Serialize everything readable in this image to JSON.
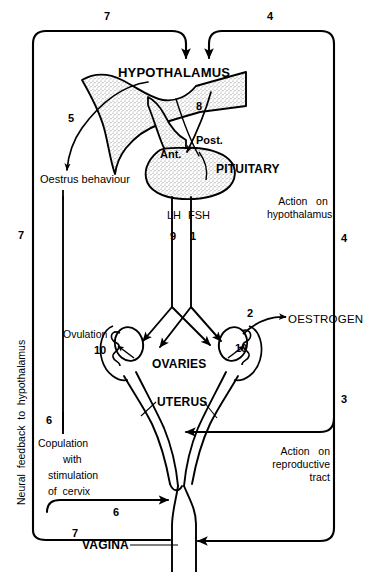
{
  "diagram": {
    "type": "biological-flow-diagram",
    "ink_color": "#000000",
    "background_color": "#ffffff",
    "stipple_color": "#9a9a9a"
  },
  "anatomy": [
    {
      "id": "hypothalamus",
      "label": "HYPOTHALAMUS",
      "style": "bold"
    },
    {
      "id": "pituitary",
      "label": "PITUITARY",
      "style": "bold"
    },
    {
      "id": "anterior-pituitary",
      "label": "Ant.",
      "style": "bold"
    },
    {
      "id": "posterior-pituitary",
      "label": "Post.",
      "style": "bold"
    },
    {
      "id": "ovaries",
      "label": "OVARIES",
      "style": "bold"
    },
    {
      "id": "uterus",
      "label": "UTERUS",
      "style": "bold"
    },
    {
      "id": "vagina",
      "label": "VAGINA",
      "style": "bold"
    }
  ],
  "hormones": [
    {
      "id": "lh",
      "label": "LH",
      "step": "9"
    },
    {
      "id": "fsh",
      "label": "FSH",
      "step": "1"
    },
    {
      "id": "oestrogen",
      "label": "OESTROGEN",
      "step": "2"
    }
  ],
  "events": [
    {
      "id": "oestrus-behaviour",
      "label": "Oestrus behaviour",
      "step": "5"
    },
    {
      "id": "ovulation",
      "label": "Ovulation",
      "step": "10"
    },
    {
      "id": "ovulation-right",
      "label": "",
      "step": "10"
    },
    {
      "id": "copulation",
      "label": "Copulation\nwith\nstimulation\nof cervix",
      "step": "6"
    }
  ],
  "pathways": [
    {
      "id": "action-on-hypothalamus",
      "label": "Action  on\nhypothalamus",
      "step": "4"
    },
    {
      "id": "action-on-reproductive-tract",
      "label": "Action  on\nreproductive\ntract",
      "step": "3"
    },
    {
      "id": "neural-feedback",
      "label": "Neural  feedback  to  hypothalamus",
      "step": "7"
    }
  ],
  "steps": {
    "top_left": "7",
    "top_right": "4",
    "releasing_factor": "8",
    "oestrus": "5",
    "lh": "9",
    "fsh": "1",
    "oestrogen": "2",
    "ovulation_left": "10",
    "ovulation_right": "10",
    "reproductive_tract": "3",
    "hypothalamus_action": "4",
    "copulation_upper": "6",
    "copulation_lower": "6",
    "neural_left": "7",
    "neural_bottom": "7"
  },
  "labels": {
    "hypothalamus": "HYPOTHALAMUS",
    "pituitary": "PITUITARY",
    "ant": "Ant.",
    "post": "Post.",
    "ovaries": "OVARIES",
    "uterus": "UTERUS",
    "vagina": "VAGINA",
    "lh": "LH",
    "fsh": "FSH",
    "oestrogen": "OESTROGEN",
    "oestrus_behaviour": "Oestrus behaviour",
    "ovulation": "Ovulation",
    "copulation_l1": "Copulation",
    "copulation_l2": "with",
    "copulation_l3": "stimulation",
    "copulation_l4": "of  cervix",
    "action_hypo_l1": "Action   on",
    "action_hypo_l2": "hypothalamus",
    "action_tract_l1": "Action   on",
    "action_tract_l2": "reproductive",
    "action_tract_l3": "tract",
    "neural_feedback": "Neural  feedback  to  hypothalamus"
  }
}
